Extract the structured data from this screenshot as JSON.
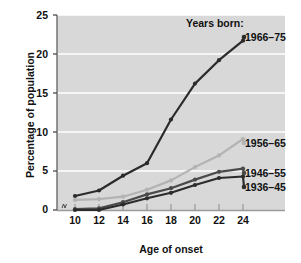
{
  "chart_data": {
    "type": "line",
    "title": "",
    "xlabel": "Age of onset",
    "ylabel": "Percentage of population",
    "legend_title": "Years born:",
    "legend_position": "right-inline",
    "grid": true,
    "x": [
      10,
      12,
      14,
      16,
      18,
      20,
      22,
      24
    ],
    "xticklabels": [
      "10",
      "12",
      "14",
      "16",
      "18",
      "20",
      "22",
      "24"
    ],
    "yticklabels": [
      "0",
      "5",
      "10",
      "15",
      "20",
      "25"
    ],
    "yticks": [
      0,
      5,
      10,
      15,
      20,
      25
    ],
    "xlim": [
      9,
      25
    ],
    "ylim": [
      0,
      25
    ],
    "series": [
      {
        "name": "1966-75",
        "label": "1966–75",
        "color": "#2b2b2b",
        "values": [
          1.8,
          2.5,
          4.4,
          6.0,
          11.6,
          16.2,
          19.2,
          21.7
        ]
      },
      {
        "name": "1956-65",
        "label": "1956–65",
        "color": "#b3b3b3",
        "values": [
          1.3,
          1.4,
          1.7,
          2.6,
          3.8,
          5.5,
          7.0,
          9.1
        ]
      },
      {
        "name": "1946-55",
        "label": "1946–55",
        "color": "#4a4a4a",
        "values": [
          0.1,
          0.2,
          1.0,
          2.0,
          2.8,
          3.9,
          4.9,
          5.3
        ]
      },
      {
        "name": "1936-45",
        "label": "1936–45",
        "color": "#2b2b2b",
        "values": [
          0.0,
          0.0,
          0.7,
          1.5,
          2.2,
          3.2,
          4.1,
          4.3
        ]
      }
    ],
    "plot_background": "#d8d8d8",
    "gridline_color": "#ffffff",
    "axis_color": "#6b6b6b"
  }
}
